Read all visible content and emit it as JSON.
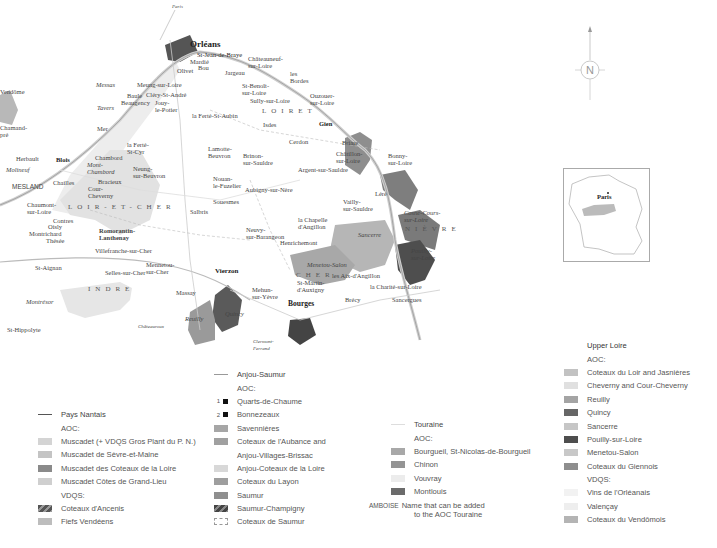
{
  "map": {
    "departments": [
      "LOIRET",
      "LOIR-ET-CHER",
      "CHER",
      "INDRE",
      "NIÈVRE"
    ],
    "places": {
      "paris_arrow": "Paris",
      "orleans": "Orléans",
      "st_jean_de_braye": "St-Jean-de-Braye",
      "mardie": "Mardié",
      "bou": "Bou",
      "olivet": "Olivet",
      "jargeau": "Jargeau",
      "chateauneuf": "Châteauneuf-\nsur-Loire",
      "st_benoit": "St-Benoît-\nsur-Loire",
      "sully": "Sully-sur-Loire",
      "les_bordes": "les\nBordes",
      "ouzouer": "Ouzouer-\nsur-Loire",
      "mareau": "Mareau",
      "meung": "Meung-sur-Loire",
      "clery": "Cléry-St-André",
      "messas": "Messas",
      "baule": "Baule",
      "beaugency": "Beaugency",
      "jouy": "Jouy-\nle-Potier",
      "tavers": "Tavers",
      "mer": "Mer",
      "la_ferte_st_aubin": "la Ferté-St-Aubin",
      "la_ferte_st_cyr": "la Ferté-\nSt-Cyr",
      "isdes": "Isdes",
      "vendome": "Vendôme",
      "chamarande": "Chamand-\npré",
      "herbault": "Herbault",
      "blois": "Blois",
      "molineuf": "Molineuf",
      "chambord": "Chambord",
      "mont_pres_chambord": "Mont-\nChambord",
      "bracieux": "Bracieux",
      "neung": "Neung-\nsur-Beuvron",
      "lamotte_beuvron": "Lamotte-\nBeuvron",
      "cerdon": "Cerdon",
      "gien": "Gien",
      "briare": "Briare",
      "chatillon": "Châtillon-\nsur-Loire",
      "bonny": "Bonny-\nsur-Loire",
      "brinon": "Brinon-\nsur-Sauldre",
      "argent": "Argent-sur-Sauldre",
      "mesland": "MESLAND",
      "chouzy": "Chouzy",
      "onzain": "Chailles",
      "cour_cheverny": "Cour-\nCheverny",
      "chaumont": "Chaumont-\nsur-Loire",
      "nouan": "Nouan-\nle-Fuzelier",
      "aubigny": "Aubigny-sur-Nère",
      "souesmes": "Souesmes",
      "salbris": "Salbris",
      "contres": "Contres",
      "oisly": "Oisly",
      "montrichard": "Montrichard",
      "thesee": "Thésée",
      "romorantin": "Romorantin-\nLanthenay",
      "villefranche": "Villefranche-sur-Cher",
      "st_aignan": "St-Aignan",
      "selles": "Selles-sur-Cher",
      "mennetou": "Mennetou-\nsur-Cher",
      "la_chapelle": "la Chapelle\nd'Angillon",
      "neuvy": "Neuvy-\nsur-Barangeon",
      "henrichemont": "Henrichemont",
      "vailly": "Vailly-\nsur-Sauldre",
      "lere": "Léré",
      "cosne": "Cosne-Cours-\nsur-Loire",
      "sancerre": "Sancerre",
      "pouilly": "Pouilly-\nsur-Loire",
      "vierzon": "Vierzon",
      "menetou_salon": "Menetou-Salon",
      "st_martin": "St-Martin-\nd'Auxigny",
      "les_aix": "les Aix-d'Angillon",
      "la_charite": "la Charité-sur-Loire",
      "sancergues": "Sancergues",
      "massay": "Massay",
      "mehun": "Mehun-\nsur-Yèvre",
      "bourges": "Bourges",
      "brecy": "Brécy",
      "reuilly": "Reuilly",
      "quincy": "Quincy",
      "st_hippolyte": "St-Hippolyte",
      "montresor": "Montrésor",
      "chateauroux": "Châteauroux",
      "clermont": "Clermont-\nFerrand"
    },
    "compass": "N",
    "inset_label": "Paris"
  },
  "legend": {
    "col1": {
      "title": "Pays Nantais",
      "aoc_heading": "AOC:",
      "aoc": [
        {
          "label": "Muscadet (+ VDQS Gros Plant du P. N.)",
          "color": "#d4d4d4"
        },
        {
          "label": "Muscadet de Sèvre-et-Maine",
          "color": "#c4c4c4"
        },
        {
          "label": "Muscadet des Coteaux de la Loire",
          "color": "#8a8a8a"
        },
        {
          "label": "Muscadet Côtes de Grand-Lieu",
          "color": "#cfcfcf"
        }
      ],
      "vdqs_heading": "VDQS:",
      "vdqs": [
        {
          "label": "Coteaux d'Ancenis",
          "color": "#6e6e6e",
          "hatched": true
        },
        {
          "label": "Fiefs Vendéens",
          "color": "#bdbdbd"
        }
      ]
    },
    "col2": {
      "title": "Anjou-Saumur",
      "aoc_heading": "AOC:",
      "numbered": [
        {
          "num": "1",
          "label": "Quarts-de-Chaume"
        },
        {
          "num": "2",
          "label": "Bonnezeaux"
        }
      ],
      "aoc": [
        {
          "label": "Savennières",
          "color": "#a6a6a6"
        },
        {
          "label": "Coteaux de l'Aubance and",
          "color": "#a0a0a0"
        },
        {
          "label": "Anjou-Villages-Brissac",
          "color": null
        },
        {
          "label": "Anjou-Coteaux de la Loire",
          "color": "#d8d8d8"
        },
        {
          "label": "Coteaux du Layon",
          "color": "#9e9e9e"
        },
        {
          "label": "Saumur",
          "color": "#8f8f8f"
        },
        {
          "label": "Saumur-Champigny",
          "color": "#5e5e5e",
          "hatched": true
        },
        {
          "label": "Coteaux de Saumur",
          "color": "dashed"
        }
      ]
    },
    "col3": {
      "title": "Touraine",
      "aoc_heading": "AOC:",
      "aoc": [
        {
          "label": "Bourgueil, St-Nicolas-de-Bourgueil",
          "color": "#a8a8a8"
        },
        {
          "label": "Chinon",
          "color": "#949494"
        },
        {
          "label": "Vouvray",
          "color": "#ececec"
        },
        {
          "label": "Montlouis",
          "color": "#6b6b6b"
        }
      ],
      "ambo_label": "AMBOISE",
      "ambo_text_1": "Name that can be added",
      "ambo_text_2": "to the AOC Touraine"
    },
    "col4": {
      "title": "Upper Loire",
      "aoc_heading": "AOC:",
      "aoc": [
        {
          "label": "Coteaux du Loir and Jasnières",
          "color": "#c2c2c2"
        },
        {
          "label": "Cheverny and Cour-Cheverny",
          "color": "#e0e0e0"
        },
        {
          "label": "Reuilly",
          "color": "#a4a4a4"
        },
        {
          "label": "Quincy",
          "color": "#666666"
        },
        {
          "label": "Sancerre",
          "color": "#c6c6c6"
        },
        {
          "label": "Pouilly-sur-Loire",
          "color": "#4e4e4e"
        },
        {
          "label": "Menetou-Salon",
          "color": "#c8c8c8"
        },
        {
          "label": "Coteaux du Giennois",
          "color": "#8e8e8e"
        }
      ],
      "vdqs_heading": "VDQS:",
      "vdqs": [
        {
          "label": "Vins de l'Orléanais",
          "color": "#f2f2f2"
        },
        {
          "label": "Valençay",
          "color": "#eeeeee"
        },
        {
          "label": "Coteaux du Vendômois",
          "color": "#b4b4b4"
        }
      ]
    }
  }
}
